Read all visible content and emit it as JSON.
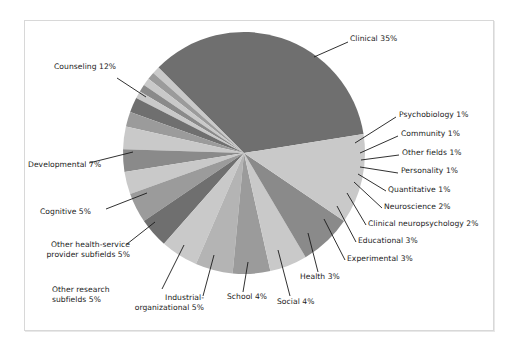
{
  "figure": {
    "background_color": "#ffffff",
    "frame_border_color": "#d8d8d8"
  },
  "chart_data": {
    "type": "pie",
    "title": "",
    "subtitle": "",
    "xlabel": "",
    "ylabel": "",
    "legend_position": "none (direct labels with leader lines)",
    "grid": false,
    "units": "percent",
    "total": 100,
    "start_angle_deg": -9,
    "direction": "clockwise",
    "categories": [
      "Clinical",
      "Psychobiology",
      "Community",
      "Other fields",
      "Personality",
      "Quantitative",
      "Neuroscience",
      "Clinical neuropsychology",
      "Educational",
      "Experimental",
      "Health",
      "Social",
      "School",
      "Industrial-organizational",
      "Other research subfields",
      "Other health-service provider subfields",
      "Cognitive",
      "Developmental",
      "Counseling"
    ],
    "values": [
      35,
      1,
      1,
      1,
      1,
      1,
      2,
      2,
      3,
      3,
      3,
      4,
      4,
      5,
      5,
      5,
      5,
      7,
      12
    ],
    "slice_colors": [
      "#6f6f6f",
      "#c9c9c9",
      "#9b9b9b",
      "#c9c9c9",
      "#8a8a8a",
      "#c9c9c9",
      "#6f6f6f",
      "#9b9b9b",
      "#c9c9c9",
      "#8a8a8a",
      "#c9c9c9",
      "#9b9b9b",
      "#6f6f6f",
      "#c9c9c9",
      "#b4b4b4",
      "#9b9b9b",
      "#c9c9c9",
      "#8a8a8a",
      "#c9c9c9"
    ],
    "labels": [
      "Clinical 35%",
      "Psychobiology 1%",
      "Community 1%",
      "Other fields 1%",
      "Personality 1%",
      "Quantitative 1%",
      "Neuroscience 2%",
      "Clinical neuropsychology 2%",
      "Educational 3%",
      "Experimental 3%",
      "Health 3%",
      "Social 4%",
      "School 4%",
      "Industrial-organizational 5%",
      "Other research subfields 5%",
      "Other health-service provider subfields 5%",
      "Cognitive 5%",
      "Developmental 7%",
      "Counseling 12%"
    ]
  },
  "labels": {
    "clinical": "Clinical 35%",
    "psychobiology": "Psychobiology 1%",
    "community": "Community 1%",
    "other_fields": "Other fields 1%",
    "personality": "Personality 1%",
    "quantitative": "Quantitative 1%",
    "neuroscience": "Neuroscience 2%",
    "clinical_neuropsychology": "Clinical neuropsychology 2%",
    "educational": "Educational 3%",
    "experimental": "Experimental 3%",
    "health": "Health 3%",
    "social": "Social 4%",
    "school": "School 4%",
    "industrial_organizational_l1": "Industrial-",
    "industrial_organizational_l2": "organizational 5%",
    "other_research_l1": "Other research",
    "other_research_l2": "subfields 5%",
    "other_hsp_l1": "Other health-service",
    "other_hsp_l2": "provider subfields 5%",
    "cognitive": "Cognitive 5%",
    "developmental": "Developmental 7%",
    "counseling": "Counseling 12%"
  }
}
